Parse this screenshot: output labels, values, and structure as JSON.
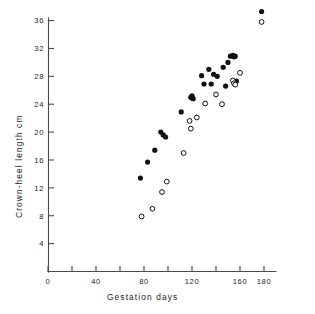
{
  "chart_data": {
    "type": "scatter",
    "title": "",
    "xlabel": "Gestation days",
    "ylabel": "Crown-heel length cm",
    "xlim": [
      0,
      180
    ],
    "ylim": [
      0,
      38
    ],
    "xticks": [
      0,
      20,
      40,
      60,
      80,
      100,
      120,
      140,
      160,
      180
    ],
    "xtick_labels": [
      "0",
      "",
      "40",
      "",
      "80",
      "",
      "120",
      "",
      "160",
      "180"
    ],
    "yticks": [
      4,
      8,
      12,
      16,
      20,
      24,
      28,
      32,
      36
    ],
    "ytick_labels": [
      "4",
      "8",
      "12",
      "16",
      "20",
      "24",
      "28",
      "32",
      "36"
    ],
    "grid": false,
    "legend": "none",
    "series": [
      {
        "name": "filled-circles",
        "marker": "filled circle",
        "color": "#121212",
        "points": [
          [
            77,
            13.4
          ],
          [
            83,
            15.7
          ],
          [
            89,
            17.4
          ],
          [
            94,
            20.0
          ],
          [
            96,
            19.6
          ],
          [
            98,
            19.3
          ],
          [
            111,
            22.9
          ],
          [
            119,
            25.0
          ],
          [
            120,
            24.9
          ],
          [
            120,
            25.2
          ],
          [
            121,
            24.8
          ],
          [
            128,
            28.1
          ],
          [
            130,
            26.9
          ],
          [
            134,
            29.0
          ],
          [
            136,
            26.9
          ],
          [
            138,
            28.3
          ],
          [
            141,
            28.0
          ],
          [
            146,
            29.3
          ],
          [
            148,
            26.6
          ],
          [
            150,
            30.0
          ],
          [
            152,
            30.9
          ],
          [
            154,
            31.0
          ],
          [
            155,
            30.8
          ],
          [
            156,
            30.9
          ],
          [
            157,
            27.3
          ],
          [
            178,
            37.3
          ]
        ]
      },
      {
        "name": "open-circles",
        "marker": "open circle",
        "color": "#ffffff",
        "points": [
          [
            78,
            7.9
          ],
          [
            87,
            9.0
          ],
          [
            95,
            11.4
          ],
          [
            99,
            12.9
          ],
          [
            113,
            17.0
          ],
          [
            118,
            21.6
          ],
          [
            119,
            20.5
          ],
          [
            124,
            22.1
          ],
          [
            131,
            24.1
          ],
          [
            140,
            25.4
          ],
          [
            145,
            24.0
          ],
          [
            154,
            27.4
          ],
          [
            155,
            27.0
          ],
          [
            156,
            26.8
          ],
          [
            160,
            28.5
          ],
          [
            178,
            35.8
          ]
        ]
      }
    ]
  },
  "axes": {
    "xlabel": "Gestation days",
    "ylabel": "Crown-heel length cm"
  }
}
